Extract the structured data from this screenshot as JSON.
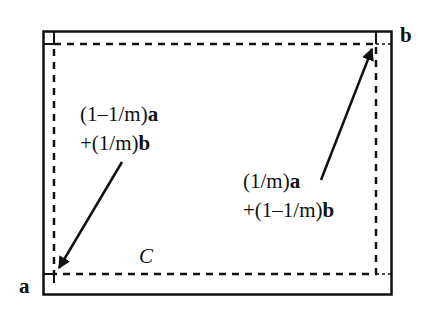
{
  "diagram": {
    "corner_labels": {
      "a": "a",
      "b": "b"
    },
    "region_label": "C",
    "left_expression": {
      "line1_prefix": "(1–1/m)",
      "line1_var": "a",
      "line2_prefix": "+(1/m)",
      "line2_var": "b"
    },
    "right_expression": {
      "line1_prefix": "(1/m)",
      "line1_var": "a",
      "line2_prefix": "+(1–1/m)",
      "line2_var": "b"
    },
    "colors": {
      "stroke": "#111111",
      "background": "#ffffff"
    }
  }
}
